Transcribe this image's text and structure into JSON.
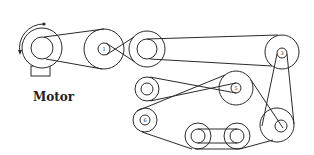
{
  "diagram": {
    "motor": {
      "label": "Motor",
      "rotation": "counterclockwise-arrow"
    },
    "pulleys": [
      {
        "id": "1",
        "label": "1"
      },
      {
        "id": "2",
        "label": ""
      },
      {
        "id": "3",
        "label": "3"
      },
      {
        "id": "4",
        "label": ""
      },
      {
        "id": "5",
        "label": "5"
      },
      {
        "id": "6",
        "label": "6"
      },
      {
        "id": "7",
        "label": ""
      },
      {
        "id": "8",
        "label": ""
      },
      {
        "id": "9",
        "label": ""
      }
    ],
    "colors": {
      "line": "#2a2a2a",
      "background": "#ffffff"
    }
  }
}
